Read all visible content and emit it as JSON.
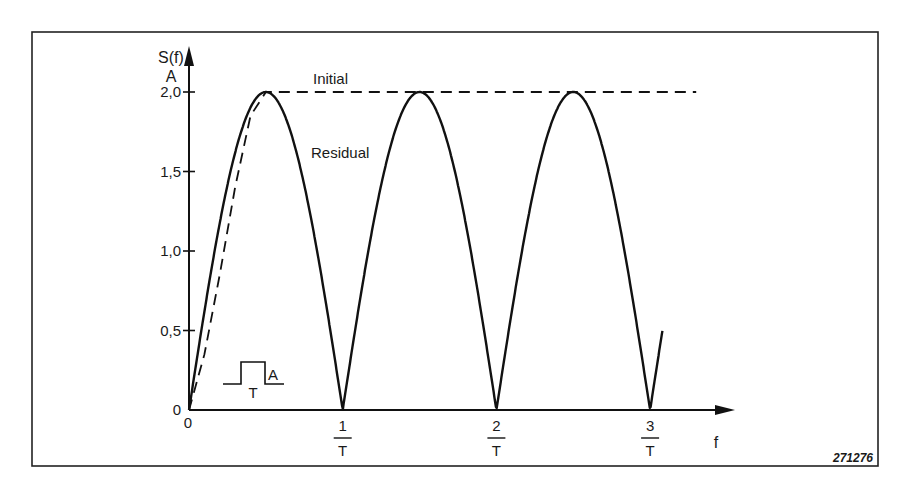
{
  "chart_data": {
    "type": "line",
    "title": "",
    "xlabel": "f",
    "ylabel": "S(f)",
    "ylabel_unit": "A",
    "xlim": [
      0,
      3.3
    ],
    "ylim": [
      0,
      2.0
    ],
    "grid": false,
    "x_ticks": [
      {
        "value": 0,
        "num": "0",
        "den": ""
      },
      {
        "value": 1,
        "num": "1",
        "den": "T"
      },
      {
        "value": 2,
        "num": "2",
        "den": "T"
      },
      {
        "value": 3,
        "num": "3",
        "den": "T"
      }
    ],
    "y_ticks": [
      "0",
      "0,5",
      "1,0",
      "1,5",
      "2,0"
    ],
    "y_tick_values": [
      0,
      0.5,
      1.0,
      1.5,
      2.0
    ],
    "series": [
      {
        "name": "Initial",
        "style": "dashed",
        "description": "Rises from 0 to 2A near f=0.5/T, then stays flat at 2A",
        "x": [
          0,
          0.1,
          0.2,
          0.3,
          0.4,
          0.5,
          1.0,
          2.0,
          3.0,
          3.3
        ],
        "values": [
          0,
          0.35,
          0.85,
          1.4,
          1.85,
          2.0,
          2.0,
          2.0,
          2.0,
          2.0
        ]
      },
      {
        "name": "Residual",
        "style": "solid",
        "description": "2A·|sin(pi f T)|, zeros at 1/T, 2/T, 3/T",
        "x": [
          0,
          0.25,
          0.5,
          0.75,
          1.0,
          1.25,
          1.5,
          1.75,
          2.0,
          2.25,
          2.5,
          2.75,
          3.0,
          3.08
        ],
        "values": [
          0,
          1.41,
          2.0,
          1.41,
          0,
          1.41,
          2.0,
          1.41,
          0,
          1.41,
          2.0,
          1.41,
          0,
          0.6
        ]
      }
    ],
    "annotations": [
      {
        "text": "Initial",
        "target": "dashed line"
      },
      {
        "text": "Residual",
        "target": "solid curve"
      },
      {
        "text": "A",
        "target": "pulse inset amplitude"
      },
      {
        "text": "T",
        "target": "pulse inset width"
      }
    ],
    "figure_id": "271276",
    "legend_position": "inline labels"
  },
  "labels": {
    "y_axis_name": "S(f)",
    "y_axis_unit": "A",
    "x_axis_name": "f",
    "origin_y": "0",
    "initial": "Initial",
    "residual": "Residual",
    "inset_amplitude": "A",
    "inset_width": "T",
    "figure_id": "271276"
  }
}
